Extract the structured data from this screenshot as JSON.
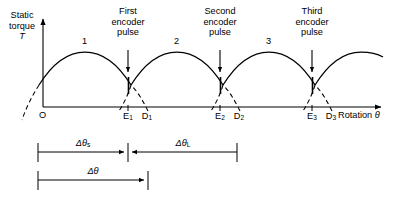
{
  "figure": {
    "type": "line"
  },
  "axes": {
    "y_label_line1": "Static",
    "y_label_line2": "torque",
    "y_label_symbol": "T",
    "x_label_text": "Rotation",
    "x_label_symbol": "θ",
    "origin_label": "O"
  },
  "curves": [
    {
      "id": "1",
      "label": "1",
      "peak_x": 85,
      "start_x": 39,
      "end_x": 131
    },
    {
      "id": "2",
      "label": "2",
      "peak_x": 177,
      "start_x": 131,
      "end_x": 223
    },
    {
      "id": "3",
      "label": "3",
      "peak_x": 269,
      "start_x": 223,
      "end_x": 315
    },
    {
      "id": "4",
      "label": "",
      "peak_x": 361,
      "start_x": 315,
      "end_x": 385
    }
  ],
  "pulses": [
    {
      "ordinal": "First",
      "line1": "First",
      "line2": "encoder",
      "line3": "pulse",
      "arrow_x": 128,
      "text_center_x": 128
    },
    {
      "ordinal": "Second",
      "line1": "Second",
      "line2": "encoder",
      "line3": "pulse",
      "arrow_x": 220,
      "text_center_x": 220
    },
    {
      "ordinal": "Third",
      "line1": "Third",
      "line2": "encoder",
      "line3": "pulse",
      "arrow_x": 312,
      "text_center_x": 312
    }
  ],
  "axis_marks": [
    {
      "name": "E1",
      "base": "E",
      "sub": "1",
      "x": 128
    },
    {
      "name": "D1",
      "base": "D",
      "sub": "1",
      "x": 147
    },
    {
      "name": "E2",
      "base": "E",
      "sub": "2",
      "x": 220
    },
    {
      "name": "D2",
      "base": "D",
      "sub": "2",
      "x": 239
    },
    {
      "name": "E3",
      "base": "E",
      "sub": "3",
      "x": 312
    },
    {
      "name": "D3",
      "base": "D",
      "sub": "3",
      "x": 331
    }
  ],
  "dimensions": [
    {
      "name": "delta-theta-s",
      "symbol": "Δθ",
      "sub": "s",
      "from_x": 38,
      "to_x": 128,
      "y": 152,
      "label_center_x": 83
    },
    {
      "name": "delta-theta-L",
      "symbol": "Δθ",
      "sub": "L",
      "from_x": 128,
      "to_x": 237,
      "y": 152,
      "label_center_x": 183
    },
    {
      "name": "delta-theta",
      "symbol": "Δθ",
      "sub": "",
      "from_x": 38,
      "to_x": 148,
      "y": 180,
      "label_center_x": 93
    }
  ],
  "colors": {
    "stroke": "#000000",
    "background": "#ffffff"
  }
}
